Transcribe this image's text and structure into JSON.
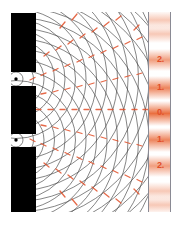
{
  "figure": {
    "background_color": "#ffffff",
    "barrier_color": "#000000",
    "wavefront_color": "#3a3a3a",
    "antinode_color": "#e2502a",
    "fringe_glow_color": "#e8622f",
    "screen_line_color": "#8a8a94"
  },
  "barrier": {
    "name": "double-slit-barrier",
    "x": 11,
    "width": 25,
    "blocks": [
      {
        "label": "upper-block",
        "y": 13,
        "height": 59
      },
      {
        "label": "middle-block",
        "y": 86,
        "height": 48
      },
      {
        "label": "lower-block",
        "y": 147,
        "height": 65
      }
    ],
    "slits": [
      {
        "label": "slit-upper",
        "cy": 79,
        "source_x": 16,
        "source_y": 79
      },
      {
        "label": "slit-lower",
        "cy": 140,
        "source_x": 16,
        "source_y": 140
      }
    ]
  },
  "waves": {
    "source_upper": {
      "cx": 16,
      "cy": 79
    },
    "source_lower": {
      "cx": 16,
      "cy": 140
    },
    "wavelength": 10.5,
    "ring_count": 17,
    "stroke_width": 0.65
  },
  "antinodes": {
    "description": "constructive-interference-dashes",
    "dash_length": 5,
    "dash_width": 1.3,
    "orders": [
      0,
      1,
      2,
      3,
      4
    ]
  },
  "screen": {
    "name": "detection-screen",
    "left_line_x": 148.5,
    "right_line_x": 170.5,
    "top": 12,
    "bottom": 212,
    "fringes": [
      {
        "order": "2",
        "label": "2.",
        "y": 60
      },
      {
        "order": "1",
        "label": "1.",
        "y": 88
      },
      {
        "order": "0",
        "label": "0.",
        "y": 113
      },
      {
        "order": "1",
        "label": "1.",
        "y": 140
      },
      {
        "order": "2",
        "label": "2.",
        "y": 166
      }
    ],
    "faint_fringes_y": [
      20,
      33,
      192,
      205
    ]
  },
  "labels": {
    "fringe_0": "0.",
    "fringe_1_upper": "1.",
    "fringe_2_upper": "2.",
    "fringe_1_lower": "1.",
    "fringe_2_lower": "2."
  }
}
